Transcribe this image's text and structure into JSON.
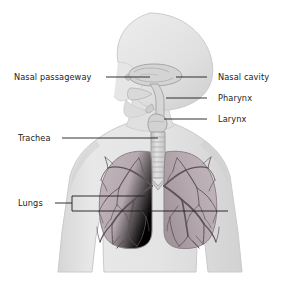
{
  "diagram": {
    "background_color": "#ffffff",
    "body_fill": "#e2e2e2",
    "body_outline": "#c9c9c9",
    "airway_fill": "#d4d4d4",
    "airway_outline": "#a8a8a8",
    "lung_fill": "#b9aeb4",
    "lung_outline": "#8d8189",
    "bronchial_tree_color": "#5d5257",
    "trachea_fill": "#d8d8d8",
    "leader_line_color": "#1b1b1b",
    "label_color": "#1b1b1b"
  },
  "labels": {
    "left": [
      {
        "id": "nasal-passageway",
        "text": "Nasal passageway",
        "x": 14,
        "y": 72,
        "leader_from_x": 106,
        "leader_to_x": 150,
        "leader_y": 77
      },
      {
        "id": "trachea",
        "text": "Trachea",
        "x": 18,
        "y": 133,
        "leader_from_x": 62,
        "leader_to_x": 158,
        "leader_y": 138
      },
      {
        "id": "lungs",
        "text": "Lungs",
        "x": 18,
        "y": 198,
        "leader_from_x": 55,
        "leader_to_x": 72,
        "leader_y": 203
      }
    ],
    "right": [
      {
        "id": "nasal-cavity",
        "text": "Nasal cavity",
        "x": 218,
        "y": 72,
        "leader_from_x": 207,
        "leader_to_x": 176,
        "leader_y": 77
      },
      {
        "id": "pharynx",
        "text": "Pharynx",
        "x": 218,
        "y": 93,
        "leader_from_x": 207,
        "leader_to_x": 166,
        "leader_y": 98
      },
      {
        "id": "larynx",
        "text": "Larynx",
        "x": 218,
        "y": 114,
        "leader_from_x": 207,
        "leader_to_x": 164,
        "leader_y": 119
      }
    ],
    "lungs_bracket": {
      "id": "lungs-bracket",
      "stem_x": 55,
      "stem_y": 203,
      "split_x": 72,
      "top_y": 196,
      "bottom_y": 211,
      "left_branch_to_x": 145,
      "right_branch_to_x": 228
    }
  }
}
